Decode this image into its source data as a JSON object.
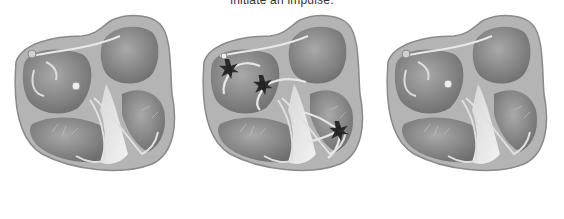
{
  "caption": "initiate an impulse.",
  "panels": [
    {
      "name": "normal-conduction",
      "labels": []
    },
    {
      "name": "ectopic-foci",
      "labels": [
        "A",
        "B",
        "C"
      ]
    },
    {
      "name": "normal-conduction-repeat",
      "labels": []
    }
  ],
  "colors": {
    "background": "#ffffff",
    "heart_wall": "#a8a8a8",
    "chamber": "#8e8e8e",
    "septum": "#c4c4c4",
    "focus": "#2a2a2a"
  }
}
